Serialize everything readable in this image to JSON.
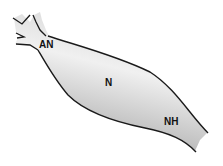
{
  "diagram": {
    "labels": {
      "an": "AN",
      "n": "N",
      "nh": "NH"
    },
    "colors": {
      "outline": "#1a1a1a",
      "fill_light": "#f2f2f2",
      "fill_dark": "#9a9a9a",
      "background": "#ffffff"
    }
  }
}
